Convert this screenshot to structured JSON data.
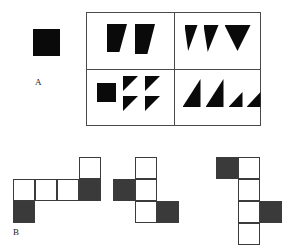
{
  "figure": {
    "labels": {
      "section_a": "A",
      "section_b": "B"
    },
    "colors": {
      "shape_fill": "#0a0a0a",
      "net_black_fill": "#3a3a3a",
      "net_white_fill": "#ffffff",
      "line": "#3b3b3b",
      "panel_border": "#4a4a4a",
      "background": "#ffffff"
    },
    "section_a": {
      "prompt_shape": {
        "name": "black-square",
        "type": "square",
        "x": 33,
        "y": 29,
        "w": 27,
        "h": 27
      },
      "panel": {
        "x": 86,
        "y": 12,
        "w": 175,
        "h": 114,
        "rows": 2,
        "cols": 2,
        "quadrants": [
          {
            "id": "top-left",
            "shape_count": 2,
            "shapes": [
              {
                "type": "trapezoid",
                "x": 20,
                "y": 11,
                "w": 20,
                "h": 28
              },
              {
                "type": "trapezoid",
                "x": 48,
                "y": 11,
                "w": 20,
                "h": 30
              }
            ]
          },
          {
            "id": "top-right",
            "shape_count": 3,
            "shapes": [
              {
                "type": "triangle-down-narrow",
                "x": 11,
                "y": 12,
                "w": 13,
                "h": 26
              },
              {
                "type": "triangle-down-narrow",
                "x": 30,
                "y": 12,
                "w": 15,
                "h": 27
              },
              {
                "type": "triangle-down-wide",
                "x": 51,
                "y": 12,
                "w": 26,
                "h": 26
              }
            ]
          },
          {
            "id": "bottom-left",
            "shape_count": 5,
            "shapes": [
              {
                "type": "square",
                "x": 10,
                "y": 14,
                "w": 19,
                "h": 19
              },
              {
                "type": "triangle-top-left",
                "x": 36,
                "y": 7,
                "w": 15,
                "h": 15
              },
              {
                "type": "triangle-top-left",
                "x": 58,
                "y": 7,
                "w": 15,
                "h": 15
              },
              {
                "type": "triangle-top-left",
                "x": 36,
                "y": 27,
                "w": 15,
                "h": 15
              },
              {
                "type": "triangle-top-left",
                "x": 58,
                "y": 27,
                "w": 15,
                "h": 15
              }
            ]
          },
          {
            "id": "bottom-right",
            "shape_count": 4,
            "shapes": [
              {
                "type": "triangle-bottom-right",
                "x": 9,
                "y": 10,
                "w": 18,
                "h": 28
              },
              {
                "type": "triangle-bottom-right",
                "x": 32,
                "y": 10,
                "w": 18,
                "h": 28
              },
              {
                "type": "triangle-bottom-right",
                "x": 55,
                "y": 23,
                "w": 14,
                "h": 15
              },
              {
                "type": "triangle-bottom-right",
                "x": 73,
                "y": 23,
                "w": 14,
                "h": 15
              }
            ]
          }
        ]
      }
    },
    "section_b": {
      "cell_size": 22,
      "nets": [
        {
          "id": "net-1",
          "x": 13,
          "y": 157,
          "cells": [
            {
              "col": 0,
              "row": 1,
              "fill": "white"
            },
            {
              "col": 1,
              "row": 1,
              "fill": "white"
            },
            {
              "col": 2,
              "row": 1,
              "fill": "white"
            },
            {
              "col": 3,
              "row": 1,
              "fill": "black"
            },
            {
              "col": 3,
              "row": 0,
              "fill": "white"
            },
            {
              "col": 0,
              "row": 2,
              "fill": "black"
            }
          ]
        },
        {
          "id": "net-2",
          "x": 113,
          "y": 157,
          "cells": [
            {
              "col": 1,
              "row": 0,
              "fill": "white"
            },
            {
              "col": 1,
              "row": 1,
              "fill": "white"
            },
            {
              "col": 1,
              "row": 2,
              "fill": "white"
            },
            {
              "col": 0,
              "row": 1,
              "fill": "black"
            },
            {
              "col": 2,
              "row": 2,
              "fill": "black"
            }
          ]
        },
        {
          "id": "net-3",
          "x": 216,
          "y": 157,
          "cells": [
            {
              "col": 1,
              "row": 0,
              "fill": "white"
            },
            {
              "col": 1,
              "row": 1,
              "fill": "white"
            },
            {
              "col": 1,
              "row": 2,
              "fill": "white"
            },
            {
              "col": 1,
              "row": 3,
              "fill": "white"
            },
            {
              "col": 0,
              "row": 0,
              "fill": "black"
            },
            {
              "col": 2,
              "row": 2,
              "fill": "black"
            }
          ]
        }
      ]
    }
  }
}
